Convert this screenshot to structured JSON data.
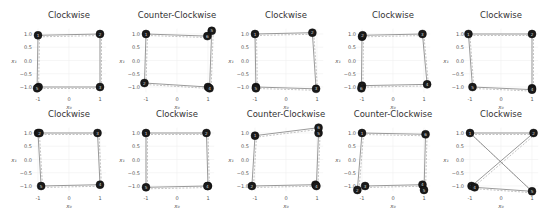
{
  "figure": {
    "rows": 2,
    "cols": 5,
    "xlabel": "x₀",
    "ylabel": "x₁",
    "xticks": [
      "-1",
      "0",
      "1"
    ],
    "yticks": [
      "1.0",
      "0.5",
      "0.0",
      "−0.5",
      "−1.0"
    ],
    "marker_color": "#1a1a1a",
    "line_color": "#555555"
  },
  "chart_data": [
    {
      "type": "scatter",
      "title": "Clockwise",
      "row": 0,
      "col": 0,
      "xlim": [
        -1.2,
        1.2
      ],
      "ylim": [
        -1.2,
        1.2
      ],
      "points": [
        {
          "label": "1",
          "x": -1.0,
          "y": 0.95
        },
        {
          "label": "2",
          "x": 1.0,
          "y": 1.0
        },
        {
          "label": "3",
          "x": 1.0,
          "y": -1.0
        },
        {
          "label": "4",
          "x": -0.98,
          "y": -1.0
        },
        {
          "label": "5",
          "x": -1.03,
          "y": -1.05
        }
      ]
    },
    {
      "type": "scatter",
      "title": "Counter-Clockwise",
      "row": 0,
      "col": 1,
      "xlim": [
        -1.2,
        1.2
      ],
      "ylim": [
        -1.2,
        1.2
      ],
      "points": [
        {
          "label": "1",
          "x": -1.0,
          "y": 1.0
        },
        {
          "label": "2",
          "x": -1.05,
          "y": -0.85
        },
        {
          "label": "3",
          "x": 1.0,
          "y": -1.0
        },
        {
          "label": "4",
          "x": 1.05,
          "y": -1.05
        },
        {
          "label": "5",
          "x": 1.12,
          "y": 1.12
        },
        {
          "label": "6",
          "x": 0.98,
          "y": 0.92
        }
      ]
    },
    {
      "type": "scatter",
      "title": "Clockwise",
      "row": 0,
      "col": 2,
      "xlim": [
        -1.2,
        1.2
      ],
      "ylim": [
        -1.2,
        1.2
      ],
      "points": [
        {
          "label": "1",
          "x": -1.0,
          "y": 1.0
        },
        {
          "label": "2",
          "x": 0.85,
          "y": 1.05
        },
        {
          "label": "3",
          "x": 0.97,
          "y": -1.07
        },
        {
          "label": "4",
          "x": -0.97,
          "y": -1.0
        },
        {
          "label": "5",
          "x": -0.97,
          "y": -1.05
        }
      ]
    },
    {
      "type": "scatter",
      "title": "Clockwise",
      "row": 0,
      "col": 3,
      "xlim": [
        -1.2,
        1.2
      ],
      "ylim": [
        -1.2,
        1.2
      ],
      "points": [
        {
          "label": "1",
          "x": -1.0,
          "y": 0.9
        },
        {
          "label": "2",
          "x": -0.98,
          "y": 0.95
        },
        {
          "label": "3",
          "x": 0.95,
          "y": 1.0
        },
        {
          "label": "4",
          "x": 1.1,
          "y": -0.9
        },
        {
          "label": "5",
          "x": -1.0,
          "y": -0.95
        },
        {
          "label": "6",
          "x": -1.02,
          "y": -1.05
        }
      ]
    },
    {
      "type": "scatter",
      "title": "Clockwise",
      "row": 0,
      "col": 4,
      "xlim": [
        -1.2,
        1.2
      ],
      "ylim": [
        -1.2,
        1.2
      ],
      "points": [
        {
          "label": "1",
          "x": -1.05,
          "y": 1.0
        },
        {
          "label": "2",
          "x": 1.0,
          "y": 1.0
        },
        {
          "label": "3",
          "x": 1.0,
          "y": -1.05
        },
        {
          "label": "4",
          "x": 1.0,
          "y": -1.1
        },
        {
          "label": "5",
          "x": -0.92,
          "y": -1.0
        }
      ]
    },
    {
      "type": "scatter",
      "title": "Clockwise",
      "row": 1,
      "col": 0,
      "xlim": [
        -1.2,
        1.2
      ],
      "ylim": [
        -1.2,
        1.2
      ],
      "points": [
        {
          "label": "1",
          "x": -1.0,
          "y": 1.0
        },
        {
          "label": "2",
          "x": -0.95,
          "y": 1.0
        },
        {
          "label": "3",
          "x": 0.92,
          "y": 1.0
        },
        {
          "label": "4",
          "x": 1.0,
          "y": -0.95
        },
        {
          "label": "5",
          "x": -0.9,
          "y": -1.0
        }
      ]
    },
    {
      "type": "scatter",
      "title": "Clockwise",
      "row": 1,
      "col": 1,
      "xlim": [
        -1.2,
        1.2
      ],
      "ylim": [
        -1.2,
        1.2
      ],
      "points": [
        {
          "label": "1",
          "x": -1.0,
          "y": 1.0
        },
        {
          "label": "2",
          "x": 0.95,
          "y": 1.0
        },
        {
          "label": "3",
          "x": 1.0,
          "y": -1.0
        },
        {
          "label": "4",
          "x": 0.98,
          "y": -1.0
        },
        {
          "label": "5",
          "x": -1.0,
          "y": -1.05
        }
      ]
    },
    {
      "type": "scatter",
      "title": "Counter-Clockwise",
      "row": 1,
      "col": 2,
      "xlim": [
        -1.2,
        1.2
      ],
      "ylim": [
        -1.2,
        1.2
      ],
      "points": [
        {
          "label": "1",
          "x": -1.0,
          "y": 0.9
        },
        {
          "label": "2",
          "x": -1.1,
          "y": -1.0
        },
        {
          "label": "3",
          "x": 0.95,
          "y": -0.95
        },
        {
          "label": "4",
          "x": 0.98,
          "y": -1.0
        },
        {
          "label": "5",
          "x": 1.05,
          "y": 1.0
        },
        {
          "label": "6",
          "x": 1.05,
          "y": 1.2
        }
      ]
    },
    {
      "type": "scatter",
      "title": "Counter-Clockwise",
      "row": 1,
      "col": 3,
      "xlim": [
        -1.2,
        1.2
      ],
      "ylim": [
        -1.2,
        1.2
      ],
      "points": [
        {
          "label": "1",
          "x": -1.0,
          "y": 1.0
        },
        {
          "label": "2",
          "x": -1.15,
          "y": -1.15
        },
        {
          "label": "3",
          "x": -0.9,
          "y": -1.0
        },
        {
          "label": "4",
          "x": 0.95,
          "y": -0.95
        },
        {
          "label": "5",
          "x": 1.0,
          "y": -1.15
        },
        {
          "label": "6",
          "x": 1.05,
          "y": 0.95
        }
      ]
    },
    {
      "type": "scatter",
      "title": "Clockwise",
      "row": 1,
      "col": 4,
      "xlim": [
        -1.2,
        1.2
      ],
      "ylim": [
        -1.2,
        1.2
      ],
      "points": [
        {
          "label": "1",
          "x": -1.0,
          "y": 1.0
        },
        {
          "label": "2",
          "x": 1.05,
          "y": 1.0
        },
        {
          "label": "3",
          "x": -0.95,
          "y": -1.0
        },
        {
          "label": "4",
          "x": -0.85,
          "y": -1.05
        },
        {
          "label": "5",
          "x": 1.0,
          "y": -1.2
        }
      ]
    }
  ]
}
